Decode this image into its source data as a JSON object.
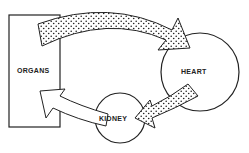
{
  "diagram": {
    "nodes": [
      {
        "id": "organs",
        "label": "ORGANS",
        "shape": "rectangle"
      },
      {
        "id": "heart",
        "label": "HEART",
        "shape": "circle"
      },
      {
        "id": "kidney",
        "label": "KIDNEY",
        "shape": "circle"
      }
    ],
    "edges": [
      {
        "from": "organs",
        "to": "heart",
        "style": "dotted-fill"
      },
      {
        "from": "heart",
        "to": "kidney",
        "style": "dotted-fill"
      },
      {
        "from": "kidney",
        "to": "organs",
        "style": "white-fill"
      }
    ],
    "colors": {
      "stroke": "#222222",
      "background": "#ffffff"
    }
  }
}
